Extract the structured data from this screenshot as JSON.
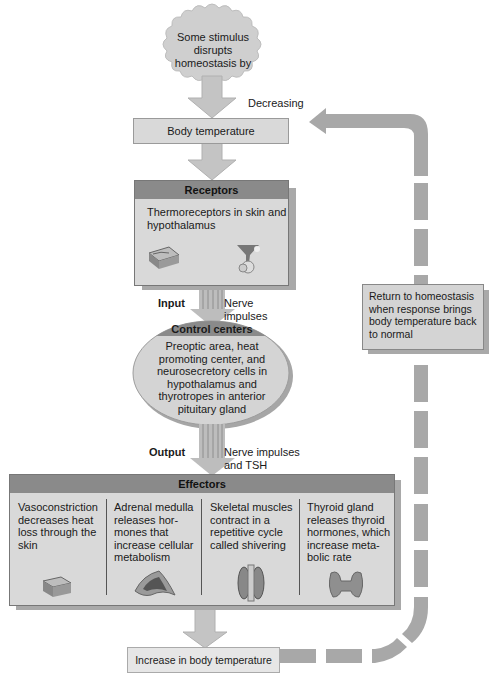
{
  "stimulus": {
    "text": "Some stimulus disrupts homeostasis by"
  },
  "change_label": "Decreasing",
  "controlled_condition": "Body temperature",
  "receptors": {
    "title": "Receptors",
    "text": "Thermoreceptors in skin and hypothalamus",
    "icons": [
      "skin-section-icon",
      "hypothalamus-icon"
    ]
  },
  "input": {
    "label": "Input",
    "signal": "Nerve impulses"
  },
  "control_centers": {
    "title": "Control centers",
    "text": "Preoptic area, heat promoting center, and neurosecretory cells in hypothalamus and thyrotropes in anterior pituitary gland"
  },
  "output": {
    "label": "Output",
    "signal": "Nerve impulses and TSH"
  },
  "effectors": {
    "title": "Effectors",
    "items": [
      {
        "text": "Vasoconstriction decreases heat loss through the skin",
        "icon": "skin-section-icon"
      },
      {
        "text": "Adrenal medulla releases hor-mones that increase cellular metabolism",
        "icon": "adrenal-gland-icon"
      },
      {
        "text": "Skeletal muscles contract in a repetitive cycle called shivering",
        "icon": "skeletal-muscle-icon"
      },
      {
        "text": "Thyroid gland releases thyroid hormones, which increase meta-bolic rate",
        "icon": "thyroid-gland-icon"
      }
    ]
  },
  "response": "Increase in body temperature",
  "return_note": "Return to homeostasis when response brings body temperature back to normal",
  "colors": {
    "box_fill": "#d9d9d9",
    "header_fill": "#8a8a8a",
    "arrow_fill": "#c8c8c8",
    "feedback_dash": "#a8a8a8"
  }
}
